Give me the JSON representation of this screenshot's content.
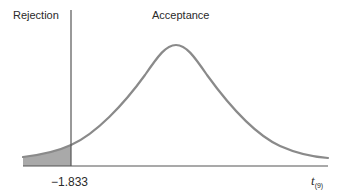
{
  "figure": {
    "regions": {
      "rejection_label": "Rejection",
      "acceptance_label": "Acceptance"
    },
    "critical_value_label": "−1.833",
    "critical_value": -1.833,
    "axis": {
      "variable": "t",
      "subscript": "(9)"
    },
    "distribution": "t",
    "degrees_of_freedom": 9,
    "tail": "left",
    "colors": {
      "curve": "#8a8a8a",
      "shade": "#a9a9a9",
      "axis": "#555555",
      "divider": "#555555",
      "text": "#2a2a2a"
    }
  }
}
